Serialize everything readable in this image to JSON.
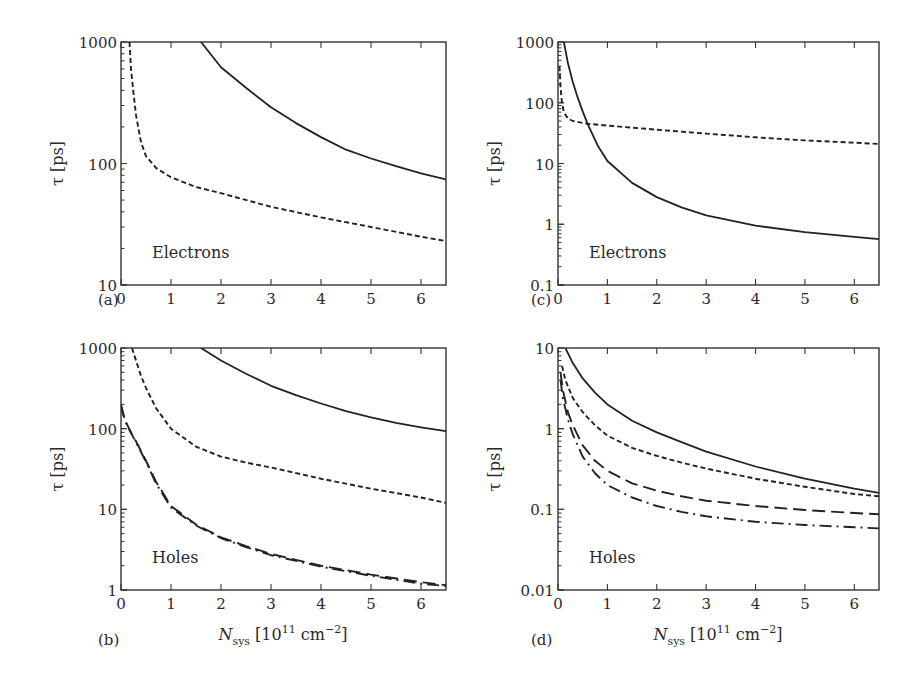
{
  "figure": {
    "xlabel_main": "N",
    "xlabel_sub": "sys",
    "xlabel_unit_pre": " [10",
    "xlabel_unit_exp": "11",
    "xlabel_unit_mid": " cm",
    "xlabel_unit_exp2": "−2",
    "xlabel_unit_post": "]",
    "ylabel": "τ [ps]"
  },
  "chart_data": [
    {
      "panel": "(a)",
      "type": "line",
      "annotation": "Electrons",
      "xlabel": "",
      "ylabel": "τ [ps]",
      "xlim": [
        0,
        6.5
      ],
      "ylim": [
        10,
        1000
      ],
      "yscale": "log",
      "xticks": [
        "0",
        "1",
        "2",
        "3",
        "4",
        "5",
        "6"
      ],
      "yticks": [
        "10",
        "100",
        "1000"
      ],
      "series": [
        {
          "name": "solid",
          "style": "solid",
          "x": [
            1.6,
            2,
            2.5,
            3,
            3.5,
            4,
            4.5,
            5,
            5.5,
            6,
            6.5
          ],
          "y": [
            1000,
            620,
            420,
            290,
            215,
            165,
            130,
            110,
            95,
            83,
            74
          ]
        },
        {
          "name": "dashed",
          "style": "dashed",
          "x": [
            0.17,
            0.2,
            0.25,
            0.3,
            0.4,
            0.5,
            0.7,
            1,
            1.5,
            2,
            3,
            4,
            5,
            6,
            6.5
          ],
          "y": [
            1000,
            600,
            380,
            250,
            150,
            115,
            92,
            77,
            64,
            57,
            44,
            36,
            30,
            25,
            23
          ]
        }
      ]
    },
    {
      "panel": "(b)",
      "type": "line",
      "annotation": "Holes",
      "xlabel": "N_sys [10^11 cm^-2]",
      "ylabel": "τ [ps]",
      "xlim": [
        0,
        6.5
      ],
      "ylim": [
        1,
        1000
      ],
      "yscale": "log",
      "xticks": [
        "0",
        "1",
        "2",
        "3",
        "4",
        "5",
        "6"
      ],
      "yticks": [
        "1",
        "10",
        "100",
        "1000"
      ],
      "series": [
        {
          "name": "solid",
          "style": "solid",
          "x": [
            1.6,
            2,
            2.5,
            3,
            3.5,
            4,
            4.5,
            5,
            5.5,
            6,
            6.5
          ],
          "y": [
            1000,
            700,
            480,
            340,
            260,
            205,
            165,
            138,
            118,
            104,
            93
          ]
        },
        {
          "name": "dashed",
          "style": "dashed",
          "x": [
            0.22,
            0.3,
            0.4,
            0.5,
            0.7,
            1,
            1.5,
            2,
            2.5,
            3,
            4,
            5,
            6,
            6.5
          ],
          "y": [
            1000,
            700,
            450,
            320,
            180,
            100,
            60,
            45,
            38,
            33,
            24,
            18,
            14,
            12
          ]
        },
        {
          "name": "long-dashed",
          "style": "longdash",
          "x": [
            0,
            0.05,
            0.1,
            0.2,
            0.3,
            0.5,
            0.7,
            1,
            1.5,
            2,
            2.5,
            3,
            4,
            5,
            6,
            6.5
          ],
          "y": [
            200,
            150,
            120,
            90,
            70,
            40,
            22,
            11,
            6.5,
            4.5,
            3.5,
            2.8,
            2.0,
            1.55,
            1.25,
            1.15
          ]
        },
        {
          "name": "dash-dot",
          "style": "dashdot",
          "x": [
            0,
            0.05,
            0.1,
            0.2,
            0.3,
            0.5,
            0.7,
            1,
            1.5,
            2,
            2.5,
            3,
            4,
            5,
            6,
            6.5
          ],
          "y": [
            190,
            145,
            118,
            88,
            68,
            39,
            21,
            10.5,
            6.3,
            4.4,
            3.4,
            2.7,
            1.95,
            1.5,
            1.2,
            1.12
          ]
        }
      ]
    },
    {
      "panel": "(c)",
      "type": "line",
      "annotation": "Electrons",
      "xlabel": "",
      "ylabel": "τ [ps]",
      "xlim": [
        0,
        6.5
      ],
      "ylim": [
        0.1,
        1000
      ],
      "yscale": "log",
      "xticks": [
        "0",
        "1",
        "2",
        "3",
        "4",
        "5",
        "6"
      ],
      "yticks": [
        "0.1",
        "1",
        "10",
        "100",
        "1000"
      ],
      "series": [
        {
          "name": "solid",
          "style": "solid",
          "x": [
            0.12,
            0.2,
            0.3,
            0.4,
            0.5,
            0.6,
            0.8,
            1,
            1.5,
            2,
            2.5,
            3,
            4,
            5,
            6,
            6.5
          ],
          "y": [
            1000,
            450,
            220,
            120,
            72,
            45,
            20,
            11,
            4.8,
            2.8,
            1.9,
            1.4,
            0.95,
            0.74,
            0.62,
            0.57
          ]
        },
        {
          "name": "dashed",
          "style": "dashed",
          "x": [
            0.03,
            0.05,
            0.08,
            0.12,
            0.2,
            0.3,
            0.6,
            1,
            2,
            3,
            4,
            5,
            6,
            6.5
          ],
          "y": [
            400,
            180,
            100,
            70,
            55,
            50,
            45,
            42,
            36,
            31,
            27,
            24,
            22,
            21
          ]
        }
      ]
    },
    {
      "panel": "(d)",
      "type": "line",
      "annotation": "Holes",
      "xlabel": "N_sys [10^11 cm^-2]",
      "ylabel": "τ [ps]",
      "xlim": [
        0,
        6.5
      ],
      "ylim": [
        0.01,
        10
      ],
      "yscale": "log",
      "xticks": [
        "0",
        "1",
        "2",
        "3",
        "4",
        "5",
        "6"
      ],
      "yticks": [
        "0.01",
        "0.1",
        "1",
        "10"
      ],
      "series": [
        {
          "name": "solid",
          "style": "solid",
          "x": [
            0.15,
            0.3,
            0.5,
            0.75,
            1,
            1.5,
            2,
            2.5,
            3,
            4,
            5,
            6,
            6.5
          ],
          "y": [
            10,
            6.5,
            4.2,
            2.8,
            2.0,
            1.25,
            0.9,
            0.68,
            0.52,
            0.34,
            0.24,
            0.18,
            0.16
          ]
        },
        {
          "name": "dashed",
          "style": "dashed",
          "x": [
            0.08,
            0.15,
            0.3,
            0.5,
            0.75,
            1,
            1.5,
            2,
            2.5,
            3,
            4,
            5,
            6,
            6.5
          ],
          "y": [
            6,
            4,
            2.4,
            1.6,
            1.1,
            0.82,
            0.58,
            0.46,
            0.38,
            0.32,
            0.24,
            0.19,
            0.155,
            0.145
          ]
        },
        {
          "name": "long-dashed",
          "style": "longdash",
          "x": [
            0.05,
            0.1,
            0.2,
            0.3,
            0.5,
            0.75,
            1,
            1.5,
            2,
            2.5,
            3,
            4,
            5,
            6,
            6.5
          ],
          "y": [
            5,
            3,
            1.6,
            1.1,
            0.62,
            0.4,
            0.3,
            0.21,
            0.17,
            0.145,
            0.128,
            0.11,
            0.098,
            0.09,
            0.087
          ]
        },
        {
          "name": "dash-dot",
          "style": "dashdot",
          "x": [
            0.05,
            0.1,
            0.2,
            0.3,
            0.5,
            0.75,
            1,
            1.5,
            2,
            2.5,
            3,
            4,
            5,
            6,
            6.5
          ],
          "y": [
            4,
            2.4,
            1.3,
            0.85,
            0.45,
            0.28,
            0.2,
            0.14,
            0.11,
            0.093,
            0.082,
            0.07,
            0.064,
            0.06,
            0.058
          ]
        }
      ]
    }
  ]
}
